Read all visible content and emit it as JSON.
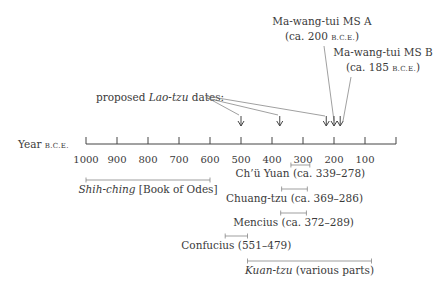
{
  "axis": {
    "label": "Year",
    "label_suffix": "B.C.E.",
    "ticks": [
      1000,
      900,
      800,
      700,
      600,
      500,
      400,
      300,
      200,
      100,
      0
    ],
    "tick_labels": [
      "1000",
      "900",
      "800",
      "700",
      "600",
      "500",
      "400",
      "300",
      "200",
      "100"
    ]
  },
  "proposed": {
    "prefix": "proposed ",
    "italic": "Lao-tzu",
    "suffix": " dates:",
    "dates": [
      500,
      375,
      225,
      200,
      180
    ]
  },
  "manuscripts": [
    {
      "title": "Ma-wang-tui MS A",
      "date_prefix": "(ca. 200 ",
      "date_sc": "B.C.E.",
      "date_suffix": ")",
      "year": 200
    },
    {
      "title": "Ma-wang-tui MS B",
      "date_prefix": "(ca. 185 ",
      "date_sc": "B.C.E.",
      "date_suffix": ")",
      "year": 185
    }
  ],
  "spans": [
    {
      "id": "chu-yuan",
      "label": "Ch’ü Yuan (ca. 339–278)",
      "italic": "",
      "rest": "",
      "start": 339,
      "end": 278
    },
    {
      "id": "shih-ching",
      "label": "",
      "italic": "Shih-ching",
      "rest": " [Book of Odes]",
      "start": 1000,
      "end": 600
    },
    {
      "id": "chuang-tzu",
      "label": "Chuang-tzu (ca. 369–286)",
      "italic": "",
      "rest": "",
      "start": 369,
      "end": 286
    },
    {
      "id": "mencius",
      "label": "Mencius (ca. 372–289)",
      "italic": "",
      "rest": "",
      "start": 372,
      "end": 289
    },
    {
      "id": "confucius",
      "label": "Confucius (551–479)",
      "italic": "",
      "rest": "",
      "start": 551,
      "end": 479
    },
    {
      "id": "kuan-tzu",
      "label": "",
      "italic": "Kuan-tzu",
      "rest": " (various parts)",
      "start": 479,
      "end": 79
    }
  ]
}
